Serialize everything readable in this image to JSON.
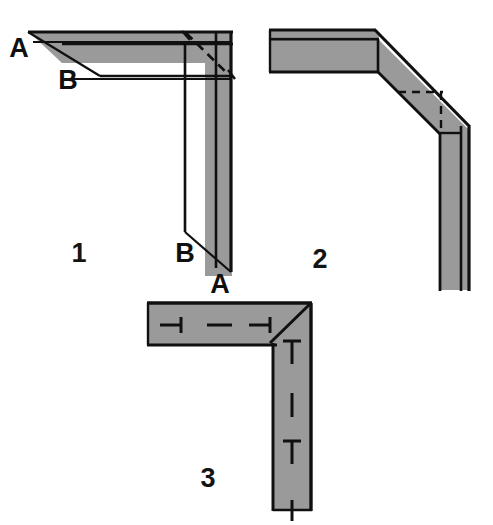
{
  "figure": {
    "background_color": "#ffffff",
    "fill_color": "#9a9a9a",
    "line_color": "#101010",
    "label_color": "#101010"
  },
  "panels": [
    {
      "id": "panel-1",
      "number": "1",
      "joint_type": "square-butt-corner-with-mitre-reference",
      "description": "L-shaped corner drawn in perspective with dashed 45 degree mitre line across the corner block",
      "labels": [
        {
          "id": "a-top-left",
          "text": "A",
          "points_to": "outer-top-edge-horizontal-arm"
        },
        {
          "id": "b-top-left",
          "text": "B",
          "points_to": "inner-top-edge-horizontal-arm"
        },
        {
          "id": "b-bottom-right",
          "text": "B",
          "points_to": "inner-edge-vertical-leg"
        },
        {
          "id": "a-bottom-right",
          "text": "A",
          "points_to": "outer-edge-vertical-leg"
        }
      ],
      "has_dashed_mitre": true
    },
    {
      "id": "panel-2",
      "number": "2",
      "joint_type": "chamfered-bevel-corner",
      "description": "L-shaped corner with 45 degree chamfered bevel band replacing the sharp corner, dashed lines marking the hidden square corner",
      "labels": [],
      "has_dashed_mitre": true
    },
    {
      "id": "panel-3",
      "number": "3",
      "joint_type": "mitred-corner-with-fasteners",
      "description": "L-shaped corner with a 45 degree mitre line at the corner and fastener centre-line symbols along both arms",
      "labels": [],
      "has_dashed_mitre": false,
      "fasteners": {
        "horizontal_arm": [
          {
            "id": "h-fastener-1",
            "symbol": "tee-left",
            "note": "fastener centre mark"
          },
          {
            "id": "h-fastener-2",
            "symbol": "dash",
            "note": "fastener centre mark"
          },
          {
            "id": "h-fastener-3",
            "symbol": "tee-left",
            "note": "fastener centre mark"
          }
        ],
        "vertical_arm": [
          {
            "id": "v-fastener-1",
            "symbol": "tee-down",
            "note": "fastener centre mark"
          },
          {
            "id": "v-fastener-2",
            "symbol": "dash",
            "note": "fastener centre mark"
          },
          {
            "id": "v-fastener-3",
            "symbol": "tee-down",
            "note": "fastener centre mark"
          },
          {
            "id": "v-fastener-4",
            "symbol": "stem",
            "note": "fastener centre mark extending past edge"
          }
        ]
      }
    }
  ]
}
